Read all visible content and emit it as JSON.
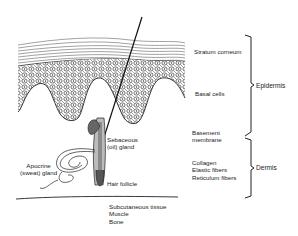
{
  "figure": {
    "type": "skin cross-section diagram",
    "layers": {
      "stratum_corneum": "Stratum corneum",
      "basal_cells": "Basal cells",
      "basement_membrane": [
        "Basement",
        "membrane"
      ],
      "dermis_components": [
        "Collagen",
        "Elastic fibers",
        "Reticulum fibers"
      ],
      "subcutaneous": [
        "Subcutaneous tissue",
        "Muscle",
        "Bone"
      ]
    },
    "structures": {
      "sebaceous_gland": [
        "Sebaceous",
        "(oil) gland"
      ],
      "apocrine_gland": [
        "Apocrine",
        "(sweat) gland"
      ],
      "hair_follicle": "Hair follicle"
    },
    "brackets": {
      "epidermis": "Epidermis",
      "dermis": "Dermis"
    },
    "colors": {
      "ink": "#222222",
      "background": "#ffffff"
    }
  }
}
